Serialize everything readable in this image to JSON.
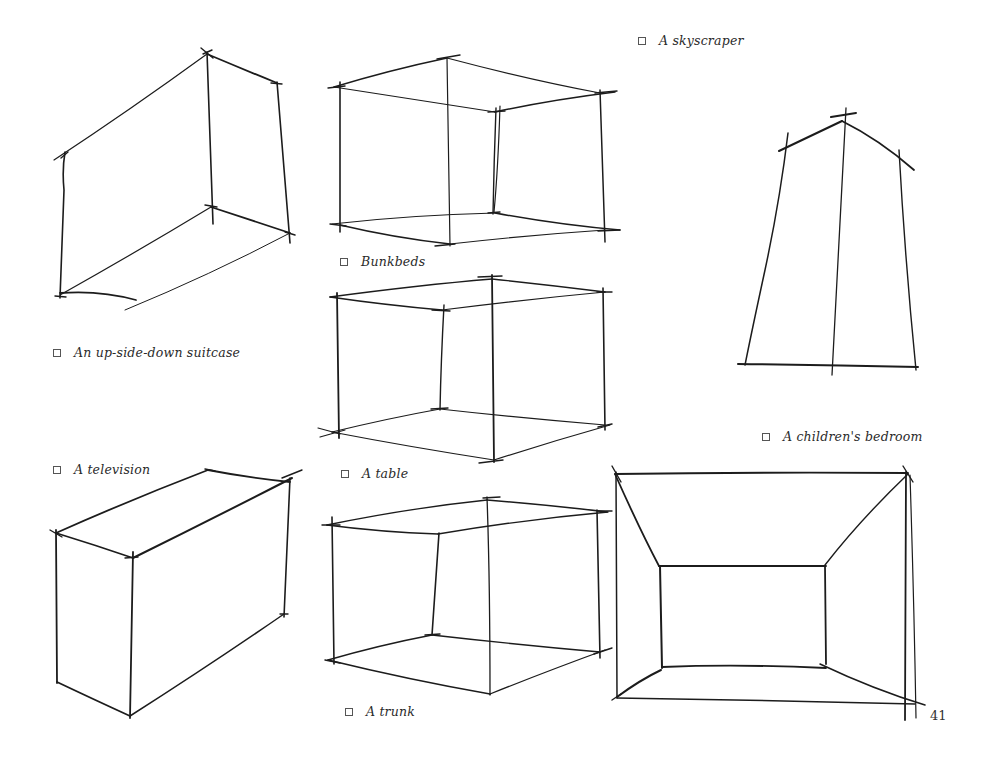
{
  "page": {
    "number": "41",
    "ink_color": "#1c1c1c"
  },
  "items": [
    {
      "id": "skyscraper",
      "label": "A skyscraper",
      "checked": false
    },
    {
      "id": "bunkbeds",
      "label": "Bunkbeds",
      "checked": false
    },
    {
      "id": "suitcase",
      "label": "An up-side-down suitcase",
      "checked": false
    },
    {
      "id": "childrens-bedroom",
      "label": "A children's bedroom",
      "checked": false
    },
    {
      "id": "television",
      "label": "A television",
      "checked": false
    },
    {
      "id": "table",
      "label": "A table",
      "checked": false
    },
    {
      "id": "trunk",
      "label": "A trunk",
      "checked": false
    }
  ],
  "checkbox_icon": "empty-square"
}
